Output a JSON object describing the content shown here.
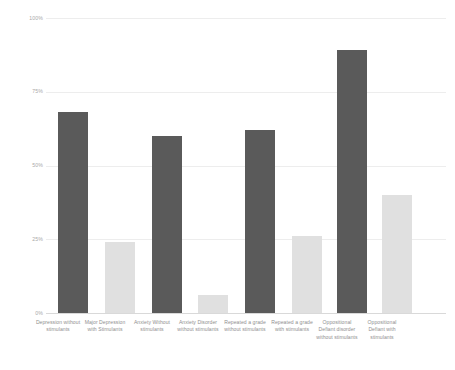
{
  "chart_data": {
    "type": "bar",
    "title": "",
    "subtitle": "",
    "xlabel": "",
    "ylabel": "",
    "ylim": [
      0,
      100
    ],
    "grid": true,
    "legend": "none",
    "y_ticks": [
      "0%",
      "25%",
      "50%",
      "75%",
      "100%"
    ],
    "y_tick_values": [
      0,
      25,
      50,
      75,
      100
    ],
    "categories": [
      "Depression without stimulants",
      "Major Depression with Stimulants",
      "Anxiety Without stimulants",
      "Anxiety Disorder without stimulants",
      "Repeated a grade without stimulants",
      "Repeated a grade with stimulants",
      "Oppositional Defiant disorder without stimulants",
      "Oppositional Defiant with stimulants"
    ],
    "values": [
      68,
      24,
      60,
      6,
      62,
      26,
      89,
      40
    ],
    "bar_colors": [
      "#5a5a5a",
      "#e0e0e0",
      "#5a5a5a",
      "#e0e0e0",
      "#5a5a5a",
      "#e0e0e0",
      "#5a5a5a",
      "#e0e0e0"
    ],
    "colors": {
      "dark": "#5a5a5a",
      "light": "#e0e0e0",
      "grid": "#ededed",
      "axis": "#d9d9d9",
      "tick_text": "#a9a9a9",
      "category_text": "#8f8f8f",
      "background": "#ffffff"
    }
  }
}
